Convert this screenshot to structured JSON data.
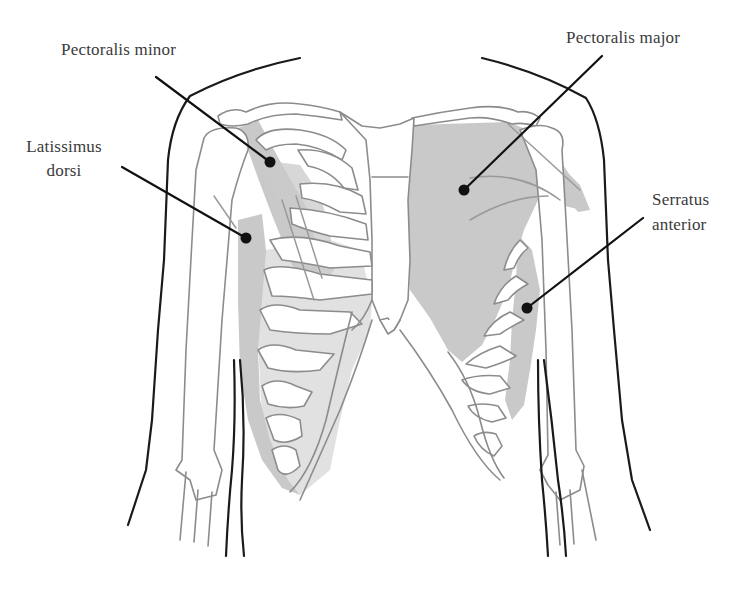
{
  "diagram": {
    "colors": {
      "background": "#ffffff",
      "muscle_fill": "#c9c9c9",
      "bone_stroke": "#8c8c8c",
      "body_outline": "#1a1a1a",
      "leader_line": "#111111",
      "label_text": "#3a3a3a"
    },
    "labels": {
      "pectoralis_minor": {
        "text": "Pectoralis minor",
        "line1": "Pectoralis minor",
        "anchor": [
          62,
          40
        ],
        "dot": [
          270,
          162
        ]
      },
      "latissimus_dorsi": {
        "text": "Latissimus dorsi",
        "line1": "Latissimus",
        "line2": "dorsi",
        "anchor": [
          23,
          152
        ],
        "dot": [
          246,
          238
        ]
      },
      "pectoralis_major": {
        "text": "Pectoralis major",
        "line1": "Pectoralis major",
        "anchor": [
          566,
          28
        ],
        "dot": [
          464,
          190
        ]
      },
      "serratus_anterior": {
        "text": "Serratus anterior",
        "line1": "Serratus",
        "line2": "anterior",
        "anchor": [
          652,
          188
        ],
        "dot": [
          527,
          308
        ]
      }
    }
  }
}
